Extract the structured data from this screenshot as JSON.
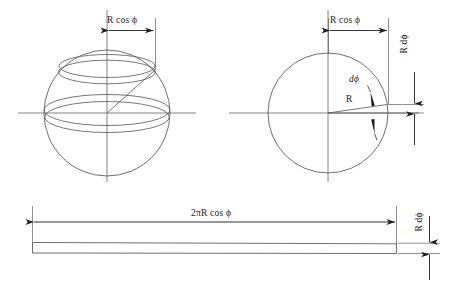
{
  "figure": {
    "background_color": "#ffffff",
    "line_color": "#555555",
    "dimension_color": "#1c1c1c",
    "text_color": "#1c1c1c"
  },
  "panels": {
    "left_sphere": {
      "name": "3D sphere with latitude band",
      "dimension_label": {
        "prefix_italic": "R",
        "space": " ",
        "function": "cos",
        "symbol": "ϕ",
        "full": "R cos ϕ"
      },
      "elements": [
        "sphere-outline-circle",
        "equator-band-upper-ellipse",
        "equator-band-lower-ellipse",
        "latitude-band-upper-ellipse",
        "latitude-band-lower-ellipse",
        "vertical-polar-axis",
        "horizontal-equatorial-axis",
        "radius-line-to-band"
      ]
    },
    "right_circle": {
      "name": "2D cross-section of sphere",
      "dimension_label_top": {
        "full": "R cos ϕ"
      },
      "dimension_label_right": {
        "full": "R dϕ"
      },
      "angle_label": {
        "full": "dϕ"
      },
      "radius_label": {
        "full": "R"
      },
      "elements": [
        "cross-section-circle",
        "vertical-axis",
        "horizontal-axis",
        "radius-line-horizontal",
        "radius-line-tilted",
        "angle-wedge",
        "angle-arrow-upper",
        "angle-arrow-lower"
      ]
    },
    "bottom_strip": {
      "name": "Unrolled strip of the spherical zone",
      "length_label": {
        "full": "2πR cos ϕ",
        "coefficient": "2π",
        "radius_italic": "R",
        "function": "cos",
        "symbol": "ϕ"
      },
      "height_label": {
        "full": "R dϕ"
      },
      "elements": [
        "strip-rectangle",
        "length-dimension-line",
        "height-dimension-line",
        "left-extension-line",
        "right-extension-line"
      ]
    }
  }
}
